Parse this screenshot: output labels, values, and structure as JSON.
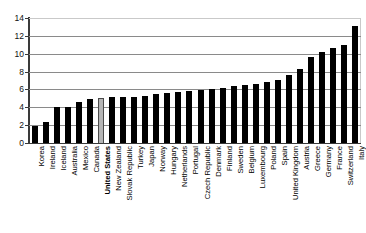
{
  "chart_data": {
    "type": "bar",
    "title": "",
    "subtitle": "",
    "xlabel": "",
    "ylabel": "",
    "ylim": [
      0,
      14
    ],
    "yticks": [
      0,
      2,
      4,
      6,
      8,
      10,
      12,
      14
    ],
    "grid": true,
    "legend": "none",
    "highlight_category": "United States",
    "highlight_color": "#b5b5b5",
    "bar_color": "#000000",
    "categories": [
      "Korea",
      "Ireland",
      "Iceland",
      "Australia",
      "Mexico",
      "Canada",
      "United States",
      "New Zealand",
      "Slovak Republic",
      "Turkey",
      "Japan",
      "Norway",
      "Hungary",
      "Netherlands",
      "Portugal",
      "Czech Republic",
      "Denmark",
      "Finland",
      "Sweden",
      "Belgium",
      "Luxembourg",
      "Poland",
      "Spain",
      "United Kingdom",
      "Austria",
      "Greece",
      "Germany",
      "France",
      "Switzerland",
      "Italy"
    ],
    "values": [
      1.9,
      2.4,
      4.0,
      4.0,
      4.6,
      4.9,
      5.0,
      5.1,
      5.1,
      5.2,
      5.3,
      5.5,
      5.6,
      5.7,
      5.8,
      5.9,
      6.0,
      6.2,
      6.4,
      6.5,
      6.6,
      6.8,
      7.1,
      7.6,
      8.3,
      9.6,
      10.2,
      10.6,
      11.0,
      13.1
    ]
  }
}
